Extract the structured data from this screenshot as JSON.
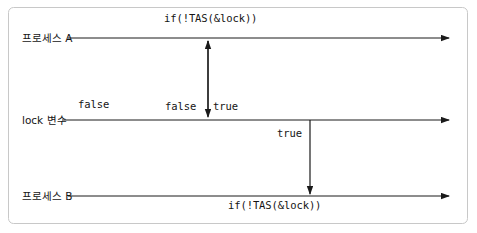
{
  "figure": {
    "type": "sequence-timeline-diagram",
    "border_color": "#c8c8c8",
    "line_color": "#1a1a1a",
    "text_color": "#141414",
    "background": "#ffffff",
    "lanes": [
      {
        "id": "process-a",
        "label": "프로세스 A",
        "y": 38
      },
      {
        "id": "lock-var",
        "label": "lock 변수",
        "y": 120
      },
      {
        "id": "process-b",
        "label": "프로세스 B",
        "y": 196
      }
    ],
    "annotations": {
      "process_a_code": "if(!TAS(&lock))",
      "process_b_code": "if(!TAS(&lock))",
      "lock_initial_value": "false",
      "lock_value_before": "false",
      "lock_value_after": "true",
      "lock_value_read_by_b": "true"
    }
  }
}
